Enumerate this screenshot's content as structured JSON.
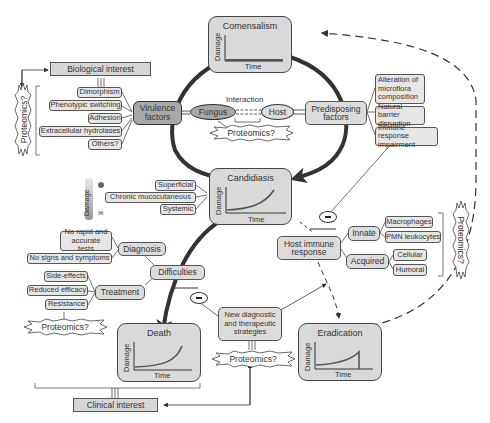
{
  "states": {
    "commensalism": {
      "title": "Comensalism",
      "y_label": "Damage",
      "x_label": "Time",
      "curve": "flat"
    },
    "candidiasis": {
      "title": "Candidiasis",
      "y_label": "Damage",
      "x_label": "Time",
      "curve": "rising"
    },
    "death": {
      "title": "Death",
      "y_label": "Damage",
      "x_label": "Time",
      "curve": "steep-rising"
    },
    "eradication": {
      "title": "Eradication",
      "y_label": "Damage",
      "x_label": "Time",
      "curve": "rise-then-drop"
    }
  },
  "interests": {
    "biological": "Biological interest",
    "clinical": "Clinical interest"
  },
  "virulence": {
    "label": "Virulence factors",
    "items": [
      "Dimorphism",
      "Phenotypic switching",
      "Adhesion",
      "Extracellular hydrolases",
      "Others?"
    ]
  },
  "interaction": {
    "label": "Interaction",
    "fungus": "Fungus",
    "host": "Host"
  },
  "predisposing": {
    "label": "Predisposing factors",
    "items": [
      "Alteration of microflora composition",
      "Natural barrier disruption",
      "Immune response impairment"
    ]
  },
  "candidiasis_types": [
    "Superficial",
    "Chronic mucocutaneous",
    "Systemic"
  ],
  "damage_scale": {
    "label": "Damage"
  },
  "difficulties": {
    "label": "Difficulties",
    "diagnosis": {
      "label": "Diagnosis",
      "items": [
        "No rapid and accurate tests",
        "No signs and symptoms"
      ]
    },
    "treatment": {
      "label": "Treatment",
      "items": [
        "Side-effects",
        "Reduced efficacy",
        "Resistance"
      ]
    }
  },
  "host_immune": {
    "label": "Host immune response",
    "innate": {
      "label": "Innate",
      "items": [
        "Macrophages",
        "PMN leukocytes"
      ]
    },
    "acquired": {
      "label": "Acquired",
      "items": [
        "Cellular",
        "Humoral"
      ]
    }
  },
  "new_strategies": "New diagnostic and therapeutic strategies",
  "proteomics": "Proteomics?",
  "inhibit_symbol": "−"
}
